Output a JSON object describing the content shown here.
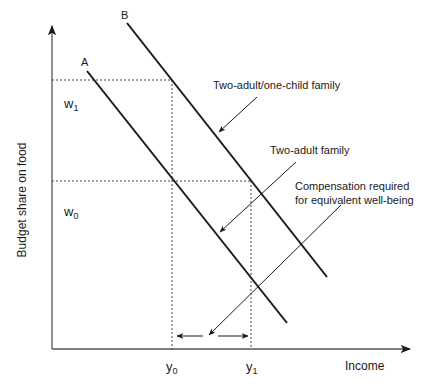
{
  "figure": {
    "axes": {
      "x_label": "Income",
      "y_label": "Budget share on food"
    },
    "curves": [
      {
        "id": "A",
        "label": "A",
        "description": "Two-adult family"
      },
      {
        "id": "B",
        "label": "B",
        "description": "Two-adult/one-child family"
      }
    ],
    "y_ticks": {
      "w1": {
        "base": "w",
        "sub": "1"
      },
      "w0": {
        "base": "w",
        "sub": "0"
      }
    },
    "x_ticks": {
      "y0": {
        "base": "y",
        "sub": "0"
      },
      "y1": {
        "base": "y",
        "sub": "1"
      }
    },
    "annotations": {
      "two_adult_one_child": "Two-adult/one-child family",
      "two_adult": "Two-adult family",
      "compensation_line1": "Compensation required",
      "compensation_line2": "for equivalent well-being"
    },
    "colors": {
      "ink": "#1a1a1a",
      "axis": "#555555",
      "guide": "#444444",
      "background": "#ffffff"
    }
  }
}
